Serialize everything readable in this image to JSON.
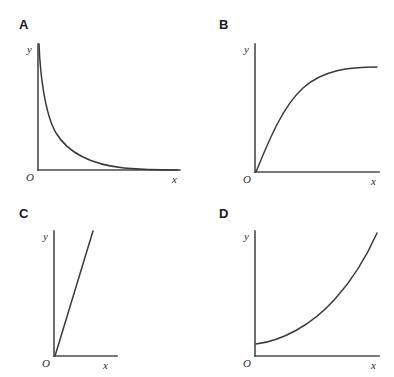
{
  "figure": {
    "background_color": "#ffffff",
    "axis_color": "#4a4a4a",
    "curve_color": "#3a3a3a",
    "label_color": "#2b2b2b",
    "letter_color": "#1a1a1a"
  },
  "panels": [
    {
      "letter": "A",
      "x_label": "x",
      "y_label": "y",
      "origin_label": "O",
      "curve_shape": "reciprocal-decay",
      "curve_path": "M 39 44 C 40 70, 44 112, 56 133 C 70 156, 96 165, 124 168 C 146 170, 166 170, 178 170"
    },
    {
      "letter": "B",
      "x_label": "x",
      "y_label": "y",
      "origin_label": "O",
      "curve_shape": "saturating-asymptotic",
      "curve_path": "M 59 172 C 72 140, 86 106, 106 88 C 126 70, 152 67, 180 67"
    },
    {
      "letter": "C",
      "x_label": "x",
      "y_label": "y",
      "origin_label": "O",
      "curve_shape": "linear-steep",
      "curve_path": "M 55 167 L 93 42"
    },
    {
      "letter": "D",
      "x_label": "x",
      "y_label": "y",
      "origin_label": "O",
      "curve_shape": "exponential-growth",
      "curve_path": "M 59 155 C 84 152, 114 137, 138 110 C 158 88, 172 62, 180 44"
    }
  ],
  "chart_data": {
    "type": "line",
    "title": "",
    "xlabel": "x",
    "ylabel": "y",
    "grid": false,
    "legend": "none",
    "subplots": [
      {
        "label": "A",
        "shape": "reciprocal decay",
        "description": "curve falls steeply from near the y-axis and flattens toward the x-axis asymptote",
        "x": [
          0.05,
          0.1,
          0.2,
          0.3,
          0.4,
          0.5,
          0.6,
          0.7,
          0.8,
          0.9,
          1.0
        ],
        "y": [
          1.0,
          0.82,
          0.52,
          0.34,
          0.24,
          0.17,
          0.13,
          0.1,
          0.08,
          0.07,
          0.06
        ],
        "xlim": [
          0,
          1
        ],
        "ylim": [
          0,
          1
        ]
      },
      {
        "label": "B",
        "shape": "saturating asymptotic",
        "description": "curve rises steeply from the origin and levels off to a horizontal plateau",
        "x": [
          0.0,
          0.1,
          0.2,
          0.3,
          0.4,
          0.5,
          0.6,
          0.7,
          0.8,
          0.9,
          1.0
        ],
        "y": [
          0.0,
          0.31,
          0.53,
          0.68,
          0.79,
          0.86,
          0.91,
          0.94,
          0.96,
          0.97,
          0.98
        ],
        "xlim": [
          0,
          1
        ],
        "ylim": [
          0,
          1
        ]
      },
      {
        "label": "C",
        "shape": "linear steep",
        "description": "straight line of steep positive slope passing through the origin",
        "x": [
          0.0,
          0.25,
          0.5,
          0.75,
          1.0
        ],
        "y": [
          0.0,
          0.25,
          0.5,
          0.75,
          1.0
        ],
        "xlim": [
          0,
          1
        ],
        "ylim": [
          0,
          1
        ]
      },
      {
        "label": "D",
        "shape": "exponential growth",
        "description": "curve starts just above the origin, stays flat, then rises sharply",
        "x": [
          0.0,
          0.1,
          0.2,
          0.3,
          0.4,
          0.5,
          0.6,
          0.7,
          0.8,
          0.9,
          1.0
        ],
        "y": [
          0.1,
          0.11,
          0.14,
          0.18,
          0.23,
          0.3,
          0.4,
          0.53,
          0.68,
          0.85,
          1.0
        ],
        "xlim": [
          0,
          1
        ],
        "ylim": [
          0,
          1
        ]
      }
    ]
  }
}
